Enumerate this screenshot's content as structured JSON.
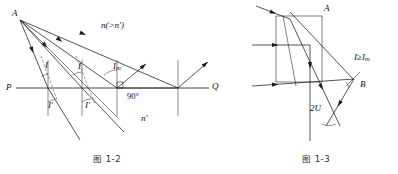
{
  "document": {
    "type": "optics-textbook-figure-pair",
    "language": "zh-CN"
  },
  "figures": [
    {
      "id": "fig-1-2",
      "caption": "图 1-2",
      "title_note": "total internal reflection at a plane interface",
      "labels": {
        "source_point": "A",
        "axis_left": "P",
        "axis_right": "Q",
        "medium_upper": "n(>n')",
        "medium_upper_parts": {
          "main": "n",
          "relation": "(>",
          "other": "n'",
          "close": ")"
        },
        "medium_lower": "n'",
        "right_angle": "90°",
        "angle_incidence_1": "I",
        "angle_incidence_2": "I",
        "angle_critical": "I",
        "angle_critical_sub": "m",
        "angle_refraction_1": "I'",
        "angle_refraction_2": "I'"
      }
    },
    {
      "id": "fig-1-3",
      "caption": "图 1-3",
      "title_note": "rays inside a prism undergoing total internal reflection",
      "labels": {
        "vertex_top": "A",
        "vertex_right": "B",
        "condition": "I",
        "condition_relation": "≥",
        "condition_limit": "I",
        "condition_limit_sub": "m",
        "angle_double_u": "2U"
      }
    }
  ],
  "colors": {
    "ink": "#1b1b1b",
    "ink_light": "#3a3a3a",
    "dashed": "#4a4a4a",
    "background": "#ffffff"
  }
}
